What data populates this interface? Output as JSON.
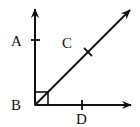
{
  "diagram": {
    "type": "geometry-angle",
    "stroke_color": "#111111",
    "background": "#ffffff",
    "vertex": {
      "label": "B",
      "x": 35,
      "y": 105
    },
    "rays": [
      {
        "name": "BA",
        "end": {
          "x": 35,
          "y": 8
        },
        "tick_label": "A",
        "tick": {
          "x": 35,
          "y": 40
        }
      },
      {
        "name": "BC",
        "end": {
          "x": 131,
          "y": 9
        },
        "tick_label": "C",
        "tick": {
          "x": 88,
          "y": 52
        }
      },
      {
        "name": "BD",
        "end": {
          "x": 132,
          "y": 105
        },
        "tick_label": "D",
        "tick": {
          "x": 82,
          "y": 105
        }
      }
    ],
    "right_angle_marker": {
      "x": 35,
      "y": 92,
      "size": 13
    },
    "labels": {
      "A": "A",
      "B": "B",
      "C": "C",
      "D": "D"
    }
  }
}
